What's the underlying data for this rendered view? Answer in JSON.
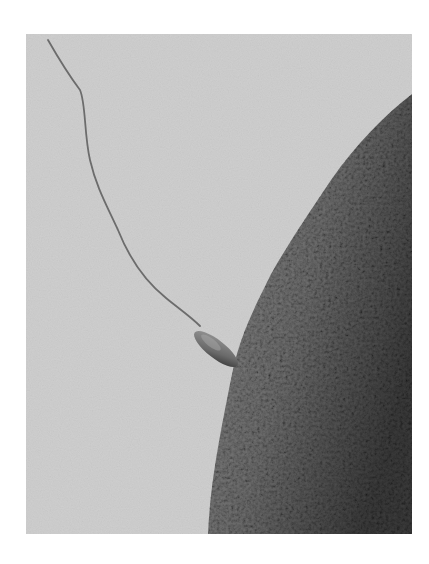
{
  "image": {
    "description": "Grayscale micrograph: a sperm cell with a long thin tail attaching to the textured surface of an egg cell",
    "colors": {
      "page_background": "#ffffff",
      "medium_background": "#cfcfcf",
      "egg_light": "#8a8a8a",
      "egg_dark": "#3a3a3a",
      "tail": "#6a6a6a",
      "head": "#7a7a7a"
    }
  }
}
